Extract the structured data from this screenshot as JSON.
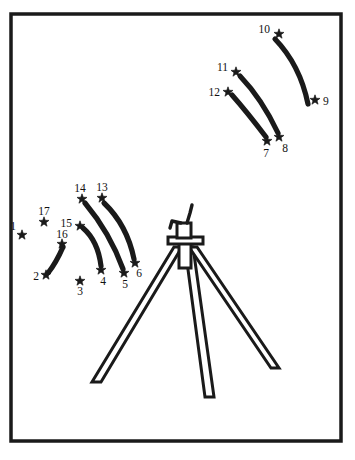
{
  "page": {
    "kind": "line-art-puzzle",
    "width": 355,
    "height": 460,
    "background_color": "#ffffff",
    "ink_color": "#1a1a1a"
  },
  "frame": {
    "name": "picture-border",
    "x": 11,
    "y": 14,
    "width": 330,
    "height": 427,
    "stroke_width": 3.5,
    "color": "#1a1a1a"
  },
  "dots": [
    {
      "id": 1,
      "label": "1",
      "star_x": 22,
      "star_y": 235,
      "label_x": 13,
      "label_y": 230,
      "label_anchor": "middle"
    },
    {
      "id": 2,
      "label": "2",
      "star_x": 46,
      "star_y": 275,
      "label_x": 36,
      "label_y": 280,
      "label_anchor": "middle"
    },
    {
      "id": 3,
      "label": "3",
      "star_x": 80,
      "star_y": 281,
      "label_x": 80,
      "label_y": 295,
      "label_anchor": "middle"
    },
    {
      "id": 4,
      "label": "4",
      "star_x": 101,
      "star_y": 270,
      "label_x": 103,
      "label_y": 285,
      "label_anchor": "middle"
    },
    {
      "id": 5,
      "label": "5",
      "star_x": 124,
      "star_y": 273,
      "label_x": 125,
      "label_y": 288,
      "label_anchor": "middle"
    },
    {
      "id": 6,
      "label": "6",
      "star_x": 135,
      "star_y": 263,
      "label_x": 139,
      "label_y": 277,
      "label_anchor": "middle"
    },
    {
      "id": 7,
      "label": "7",
      "star_x": 267,
      "star_y": 141,
      "label_x": 266,
      "label_y": 157,
      "label_anchor": "middle"
    },
    {
      "id": 8,
      "label": "8",
      "star_x": 279,
      "star_y": 137,
      "label_x": 285,
      "label_y": 152,
      "label_anchor": "middle"
    },
    {
      "id": 9,
      "label": "9",
      "star_x": 315,
      "star_y": 100,
      "label_x": 323,
      "label_y": 105,
      "label_anchor": "start"
    },
    {
      "id": 10,
      "label": "10",
      "star_x": 279,
      "star_y": 34,
      "label_x": 270,
      "label_y": 33,
      "label_anchor": "end"
    },
    {
      "id": 11,
      "label": "11",
      "star_x": 236,
      "star_y": 72,
      "label_x": 228,
      "label_y": 71,
      "label_anchor": "end"
    },
    {
      "id": 12,
      "label": "12",
      "star_x": 228,
      "star_y": 92,
      "label_x": 220,
      "label_y": 96,
      "label_anchor": "end"
    },
    {
      "id": 13,
      "label": "13",
      "star_x": 102,
      "star_y": 198,
      "label_x": 102,
      "label_y": 191,
      "label_anchor": "middle"
    },
    {
      "id": 14,
      "label": "14",
      "star_x": 82,
      "star_y": 199,
      "label_x": 80,
      "label_y": 192,
      "label_anchor": "middle"
    },
    {
      "id": 15,
      "label": "15",
      "star_x": 80,
      "star_y": 226,
      "label_x": 72,
      "label_y": 227,
      "label_anchor": "end"
    },
    {
      "id": 16,
      "label": "16",
      "star_x": 62,
      "star_y": 244,
      "label_x": 62,
      "label_y": 238,
      "label_anchor": "middle"
    },
    {
      "id": 17,
      "label": "17",
      "star_x": 44,
      "star_y": 222,
      "label_x": 44,
      "label_y": 215,
      "label_anchor": "middle"
    }
  ],
  "strokes": [
    {
      "name": "blade-stroke-2-16",
      "from": 2,
      "to": 16
    },
    {
      "name": "blade-stroke-15-4",
      "from": 15,
      "to": 4
    },
    {
      "name": "blade-stroke-14-5",
      "from": 14,
      "to": 5
    },
    {
      "name": "blade-stroke-13-6",
      "from": 13,
      "to": 6
    },
    {
      "name": "blade-stroke-12-7",
      "from": 12,
      "to": 7
    },
    {
      "name": "blade-stroke-11-8",
      "from": 11,
      "to": 8
    },
    {
      "name": "blade-stroke-10-9",
      "from": 10,
      "to": 9
    }
  ],
  "tripod": {
    "name": "tripod-stand",
    "description": "three-legged stand with head plate and crank handle"
  }
}
